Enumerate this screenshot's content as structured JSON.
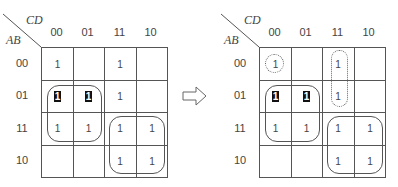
{
  "diagram": {
    "type": "karnaugh-map-transformation",
    "row_variable_label": "AB",
    "col_variable_label": "CD",
    "col_headers": [
      "00",
      "01",
      "11",
      "10"
    ],
    "row_headers": [
      "00",
      "01",
      "11",
      "10"
    ],
    "left_map": {
      "cells": [
        [
          "1",
          "",
          "1",
          ""
        ],
        [
          "1",
          "1",
          "1",
          ""
        ],
        [
          "1",
          "1",
          "1",
          "1"
        ],
        [
          "",
          "",
          "1",
          "1"
        ]
      ],
      "highlighted_cells": [
        [
          1,
          0
        ],
        [
          1,
          1
        ]
      ],
      "groups": [
        {
          "style": "solid",
          "rows": [
            "01",
            "11"
          ],
          "cols": [
            "00",
            "01"
          ]
        },
        {
          "style": "solid",
          "rows": [
            "11",
            "10"
          ],
          "cols": [
            "11",
            "10"
          ]
        }
      ]
    },
    "arrow": "right-outline-arrow",
    "right_map": {
      "cells": [
        [
          "1",
          "",
          "1",
          ""
        ],
        [
          "1",
          "1",
          "1",
          ""
        ],
        [
          "1",
          "1",
          "1",
          "1"
        ],
        [
          "",
          "",
          "1",
          "1"
        ]
      ],
      "highlighted_cells": [
        [
          1,
          0
        ],
        [
          1,
          1
        ]
      ],
      "groups": [
        {
          "style": "solid",
          "rows": [
            "01",
            "11"
          ],
          "cols": [
            "00",
            "01"
          ]
        },
        {
          "style": "solid",
          "rows": [
            "11",
            "10"
          ],
          "cols": [
            "11",
            "10"
          ]
        },
        {
          "style": "dotted",
          "rows": [
            "00"
          ],
          "cols": [
            "00"
          ]
        },
        {
          "style": "dotted",
          "rows": [
            "00",
            "01"
          ],
          "cols": [
            "11"
          ]
        }
      ]
    }
  }
}
